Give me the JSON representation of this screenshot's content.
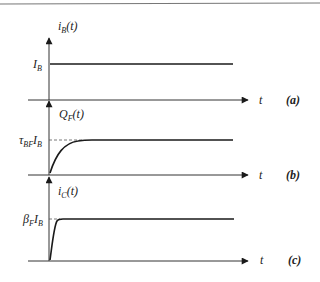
{
  "figure": {
    "panels": [
      {
        "id": "a",
        "tag": "(a)",
        "y_label_main": "i",
        "y_label_sub": "B",
        "y_label_tail": "(t)",
        "level_label_main": "I",
        "level_label_sub": "B",
        "x_label": "t",
        "waveform": "step"
      },
      {
        "id": "b",
        "tag": "(b)",
        "y_label_main": "Q",
        "y_label_sub": "F",
        "y_label_tail": "(t)",
        "level_label_main": "τ",
        "level_label_sub": "BF",
        "level_label_main2": "I",
        "level_label_sub2": "B",
        "x_label": "t",
        "waveform": "exponential-rise (slow)"
      },
      {
        "id": "c",
        "tag": "(c)",
        "y_label_main": "i",
        "y_label_sub": "C",
        "y_label_tail": "(t)",
        "level_label_main": "β",
        "level_label_sub": "F",
        "level_label_main2": "I",
        "level_label_sub2": "B",
        "x_label": "t",
        "waveform": "exponential-rise (fast)"
      }
    ]
  },
  "colors": {
    "line": "#1a1a1a",
    "axis": "#333333",
    "frame": "#777777"
  }
}
